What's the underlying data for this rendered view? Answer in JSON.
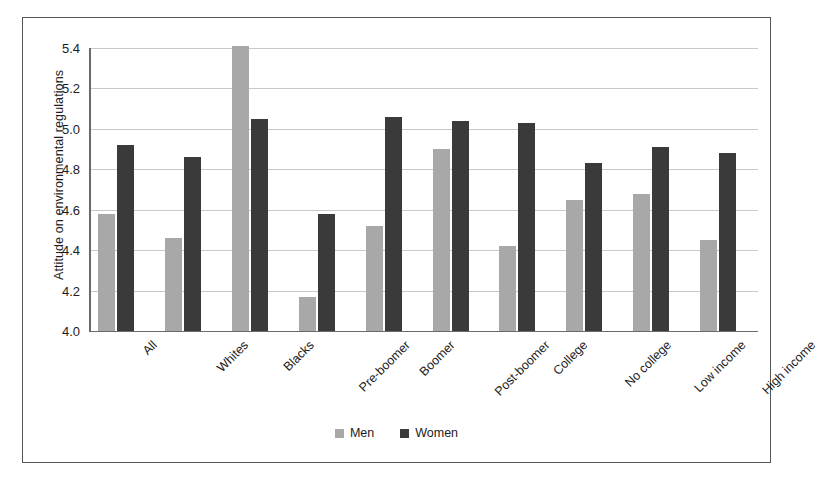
{
  "chart_data": {
    "type": "bar",
    "title": "",
    "subtitle": "",
    "xlabel": "",
    "ylabel": "Attitude on environmental regulations",
    "ylim": [
      4.0,
      5.4
    ],
    "ytick_labels": [
      "5.4",
      "5.2",
      "5.0",
      "4.8",
      "4.6",
      "4.4",
      "4.2",
      "4.0"
    ],
    "ytick_values": [
      5.4,
      5.2,
      5.0,
      4.8,
      4.6,
      4.4,
      4.2,
      4.0
    ],
    "grid": true,
    "legend_position": "bottom-center",
    "categories": [
      "All",
      "Whites",
      "Blacks",
      "Pre-boomer",
      "Boomer",
      "Post-boomer",
      "College",
      "No college",
      "Low income",
      "High income"
    ],
    "series": [
      {
        "name": "Men",
        "color": "#a8a8a8",
        "values": [
          4.58,
          4.46,
          5.41,
          4.17,
          4.52,
          4.9,
          4.42,
          4.65,
          4.68,
          4.45
        ]
      },
      {
        "name": "Women",
        "color": "#3a3a3a",
        "values": [
          4.92,
          4.86,
          5.05,
          4.58,
          5.06,
          5.04,
          5.03,
          4.83,
          4.91,
          4.88
        ]
      }
    ]
  },
  "colors": {
    "men": "#a8a8a8",
    "women": "#3a3a3a",
    "grid": "#c9c9c9",
    "axis": "#6a6a6a",
    "border": "#555555",
    "text": "#1c1c1c",
    "background": "#ffffff"
  }
}
